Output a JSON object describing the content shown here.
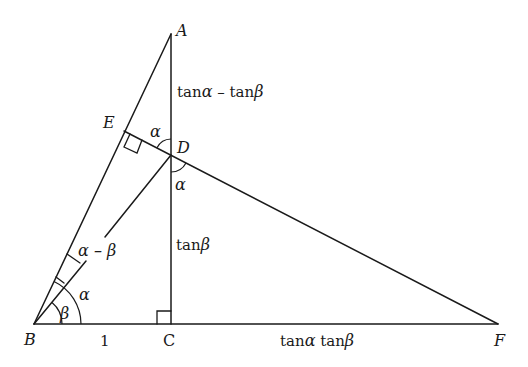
{
  "diagram": {
    "type": "geometry-proof",
    "points": {
      "A": {
        "label": "A"
      },
      "B": {
        "label": "B"
      },
      "C": {
        "label": "C"
      },
      "D": {
        "label": "D"
      },
      "E": {
        "label": "E"
      },
      "F": {
        "label": "F"
      }
    },
    "segment_labels": {
      "AD": {
        "fn": "tan",
        "a": "α",
        "op": " – ",
        "fn2": "tan",
        "b": "β"
      },
      "DC": {
        "fn": "tan",
        "b": "β"
      },
      "BC": "1",
      "CF": {
        "fn": "tan",
        "a": "α",
        "fn2": " tan",
        "b": "β"
      }
    },
    "angle_labels": {
      "ADE": "α",
      "CDF": "α",
      "ABD": "α – β",
      "CBA": "α",
      "CBD": "β"
    },
    "right_angles": [
      "E",
      "C"
    ]
  }
}
